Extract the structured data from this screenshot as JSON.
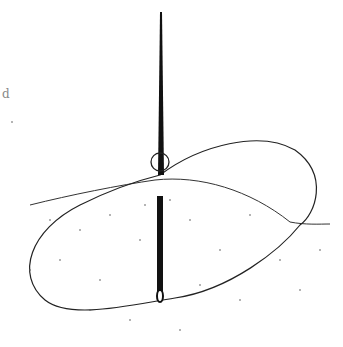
{
  "illustration": {
    "subject": "needle with thread loop piercing a surface",
    "stroke_color": "#222222",
    "dot_color": "#555555",
    "background": "#ffffff",
    "margin_mark": "d"
  }
}
